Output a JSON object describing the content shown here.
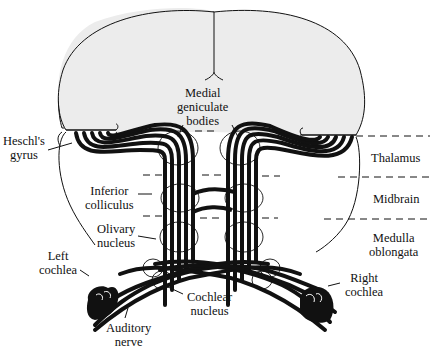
{
  "diagram": {
    "colors": {
      "background": "#ffffff",
      "hemisphere_fill": "#ececec",
      "ink": "#111111",
      "fiber_gap": "#ffffff"
    },
    "labels": {
      "medial_geniculate": [
        "Medial",
        "geniculate",
        "bodies"
      ],
      "heschls_gyrus": [
        "Heschl's",
        "gyrus"
      ],
      "inferior_colliculus": [
        "Inferior",
        "colliculus"
      ],
      "olivary_nucleus": [
        "Olivary",
        "nucleus"
      ],
      "left_cochlea": [
        "Left",
        "cochlea"
      ],
      "right_cochlea": [
        "Right",
        "cochlea"
      ],
      "cochlear_nucleus": [
        "Cochlear",
        "nucleus"
      ],
      "auditory_nerve": [
        "Auditory",
        "nerve"
      ],
      "thalamus": "Thalamus",
      "midbrain": "Midbrain",
      "medulla": [
        "Medulla",
        "oblongata"
      ]
    },
    "levels": [
      "Thalamus",
      "Midbrain",
      "Medulla oblongata"
    ]
  }
}
